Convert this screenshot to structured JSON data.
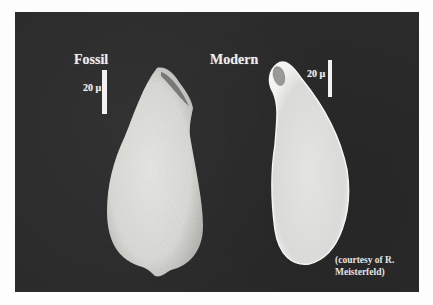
{
  "figure": {
    "background_color": "#2b2b2b",
    "page_color": "#fdfdfd",
    "specimens": [
      {
        "id": "fossil",
        "title": "Fossil",
        "scale_label": "20 µ",
        "surface": "rough, granular test"
      },
      {
        "id": "modern",
        "title": "Modern",
        "scale_label": "20 µ",
        "surface": "smooth test"
      }
    ],
    "credit_line1": "(courtesy of R.",
    "credit_line2": "Meisterfeld)"
  }
}
